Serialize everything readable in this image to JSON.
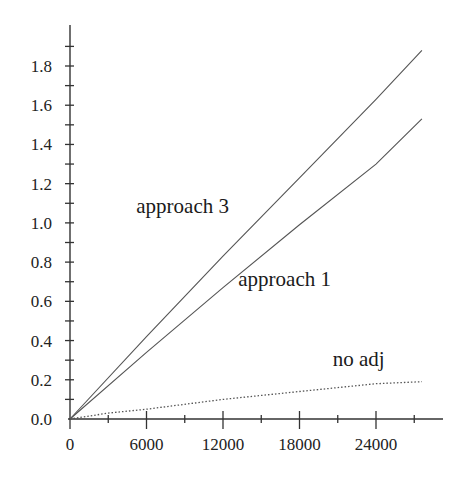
{
  "chart_data": {
    "type": "line",
    "title": "",
    "xlabel": "",
    "ylabel": "",
    "xlim": [
      0,
      27800
    ],
    "ylim": [
      0,
      2.0
    ],
    "grid": false,
    "legend": "inline labels",
    "x_ticks": [
      0,
      6000,
      12000,
      18000,
      24000
    ],
    "x_tick_labels": [
      "0",
      "6000",
      "12000",
      "18000",
      "24000"
    ],
    "x_minor_step": 3000,
    "y_ticks": [
      0.0,
      0.2,
      0.4,
      0.6,
      0.8,
      1.0,
      1.2,
      1.4,
      1.6,
      1.8
    ],
    "y_tick_labels": [
      "0.0",
      "0.2",
      "0.4",
      "0.6",
      "0.8",
      "1.0",
      "1.2",
      "1.4",
      "1.6",
      "1.8"
    ],
    "y_minor_step": 0.1,
    "series": [
      {
        "name": "approach 3",
        "style": "solid",
        "x": [
          0,
          6000,
          12000,
          18000,
          24000,
          27600
        ],
        "values": [
          0,
          0.42,
          0.83,
          1.23,
          1.63,
          1.88
        ]
      },
      {
        "name": "approach 1",
        "style": "solid",
        "x": [
          0,
          6000,
          12000,
          18000,
          24000,
          27600
        ],
        "values": [
          0,
          0.34,
          0.67,
          0.99,
          1.3,
          1.53
        ]
      },
      {
        "name": "no adj",
        "style": "dotted",
        "x": [
          0,
          3000,
          6000,
          12000,
          18000,
          24000,
          27600
        ],
        "values": [
          0,
          0.03,
          0.05,
          0.1,
          0.14,
          0.18,
          0.19
        ]
      }
    ],
    "annotations": [
      {
        "text": "approach 3",
        "x": 5200,
        "y": 1.05
      },
      {
        "text": "approach 1",
        "x": 13200,
        "y": 0.68
      },
      {
        "text": "no adj",
        "x": 20600,
        "y": 0.27
      }
    ]
  }
}
